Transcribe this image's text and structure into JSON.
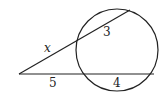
{
  "diagram": {
    "type": "two-secants-from-external-point",
    "circle": {
      "cx": 117,
      "cy": 50,
      "r": 41
    },
    "vertex": {
      "x": 19,
      "y": 74
    },
    "upper_secant": {
      "entry": {
        "x": 78,
        "y": 40
      },
      "exit": {
        "x": 130,
        "y": 10
      },
      "external_label": "x",
      "internal_label": "3"
    },
    "lower_secant": {
      "entry": {
        "x": 80,
        "y": 74
      },
      "exit": {
        "x": 154,
        "y": 74
      },
      "external_label": "5",
      "internal_label": "4"
    },
    "stroke_color": "#222222"
  }
}
